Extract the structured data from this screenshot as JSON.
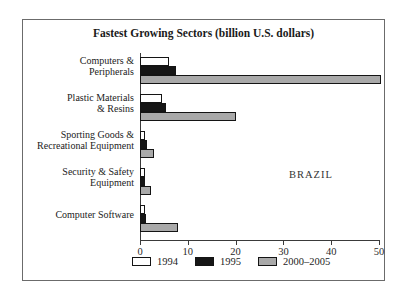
{
  "chart_data": {
    "type": "bar",
    "orientation": "horizontal",
    "title": "Fastest Growing Sectors (billion U.S. dollars)",
    "country_label": "BRAZIL",
    "categories": [
      "Computers & Peripherals",
      "Plastic Materials & Resins",
      "Sporting Goods & Recreational Equipment",
      "Security & Safety Equipment",
      "Computer Software"
    ],
    "category_lines": [
      [
        "Computers &",
        "Peripherals"
      ],
      [
        "Plastic Materials",
        "& Resins"
      ],
      [
        "Sporting Goods &",
        "Recreational Equipment"
      ],
      [
        "Security & Safety",
        "Equipment"
      ],
      [
        "Computer Software"
      ]
    ],
    "series": [
      {
        "name": "1994",
        "color": "#ffffff",
        "values": [
          6,
          4.5,
          1,
          1,
          1
        ]
      },
      {
        "name": "1995",
        "color": "#161616",
        "values": [
          7.5,
          5.5,
          1.5,
          1,
          1.2
        ]
      },
      {
        "name": "2000–2005",
        "color": "#a9a9a9",
        "values": [
          50.5,
          20,
          3,
          2.2,
          8
        ]
      }
    ],
    "x_ticks": [
      0,
      10,
      20,
      30,
      40,
      50
    ],
    "xlim": [
      0,
      50
    ],
    "grid": false,
    "legend_position": "bottom-center"
  },
  "colors": {
    "frame_border": "#6b6b6b",
    "axis": "#3a3a3a",
    "text": "#1d1d1d",
    "background": "#ffffff"
  }
}
